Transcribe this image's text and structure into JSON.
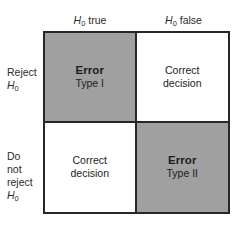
{
  "figure": {
    "kind": "hypothesis-testing-decision-matrix",
    "background_color": "#ffffff",
    "border_color": "#272727",
    "shaded_cell_color": "#a0a0a0",
    "plain_cell_color": "#ffffff"
  },
  "columns": [
    {
      "id": "h0-true",
      "label_hypothesis": "H",
      "label_subscript": "0",
      "label_state": "true"
    },
    {
      "id": "h0-false",
      "label_hypothesis": "H",
      "label_subscript": "0",
      "label_state": "false"
    }
  ],
  "rows": [
    {
      "id": "reject-h0",
      "lines": [
        "Reject"
      ],
      "hypothesis": "H",
      "subscript": "0"
    },
    {
      "id": "do-not-reject-h0",
      "lines": [
        "Do",
        "not",
        "reject"
      ],
      "hypothesis": "H",
      "subscript": "0"
    }
  ],
  "cells": {
    "top_left": {
      "line1": "Error",
      "line2": "Type I",
      "shaded": true,
      "kind": "error"
    },
    "top_right": {
      "line1": "Correct",
      "line2": "decision",
      "shaded": false,
      "kind": "correct"
    },
    "bottom_left": {
      "line1": "Correct",
      "line2": "decision",
      "shaded": false,
      "kind": "correct"
    },
    "bottom_right": {
      "line1": "Error",
      "line2": "Type II",
      "shaded": true,
      "kind": "error"
    }
  }
}
